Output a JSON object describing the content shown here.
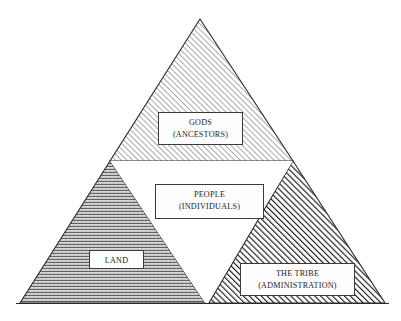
{
  "figure": {
    "name": "nested-triangle-diagram",
    "background_color": "#ffffff",
    "outline_color": "#2b2b2b",
    "text_color": "#1a1a1a",
    "box_fill_color": "#fdfdfd"
  },
  "regions": {
    "top": {
      "id": "gods-triangle",
      "line1": "GODS",
      "line2": "(ANCESTORS)",
      "fill_pattern": "light-diagonal-hatch",
      "fill_color": "#b9b9b9"
    },
    "bottom_left": {
      "id": "land-triangle",
      "line1": "LAND",
      "line2": "",
      "fill_pattern": "wavy-zigzag",
      "fill_color": "#6e6e6e"
    },
    "bottom_right": {
      "id": "tribe-triangle",
      "line1": "THE TRIBE",
      "line2": "(ADMINISTRATION)",
      "fill_pattern": "bold-diagonal-hatch",
      "fill_color": "#222222"
    },
    "center": {
      "id": "people-triangle",
      "line1": "PEOPLE",
      "line2": "(INDIVIDUALS)",
      "fill_pattern": "none",
      "fill_color": "#ffffff"
    }
  },
  "geometry": {
    "apex": [
      200,
      19
    ],
    "left_corner": [
      20,
      303
    ],
    "right_corner": [
      385,
      303
    ],
    "left_midpoint": [
      110,
      161
    ],
    "right_midpoint": [
      293,
      161
    ],
    "bottom_midpoint": [
      207,
      303
    ],
    "baseline_y": 303
  }
}
